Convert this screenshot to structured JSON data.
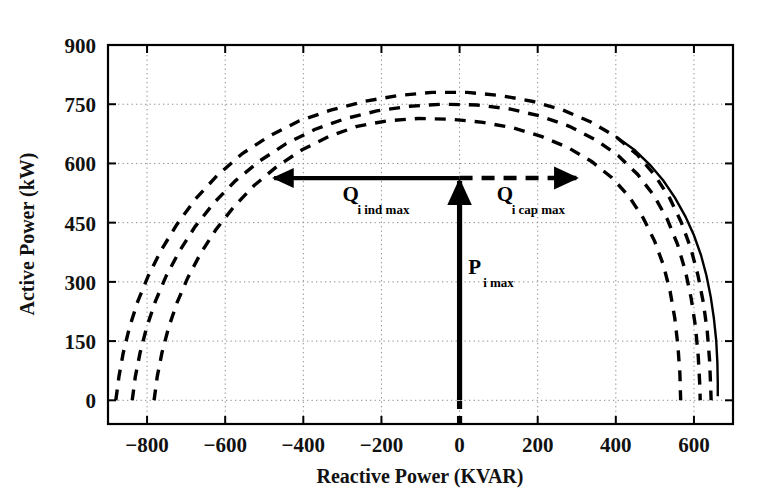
{
  "chart_data": {
    "type": "line",
    "title": "",
    "xlabel": "Reactive Power (KVAR)",
    "ylabel": "Active Power (kW)",
    "xlim": [
      -900,
      700
    ],
    "ylim": [
      -60,
      900
    ],
    "xticks": [
      -800,
      -600,
      -400,
      -200,
      0,
      200,
      400,
      600
    ],
    "yticks": [
      0,
      150,
      300,
      450,
      600,
      750,
      900
    ],
    "xtick_labels": [
      "−800",
      "−600",
      "−400",
      "−200",
      "0",
      "200",
      "400",
      "600"
    ],
    "ytick_labels": [
      "0",
      "150",
      "300",
      "450",
      "600",
      "750",
      "900"
    ],
    "grid": true,
    "legend": "none",
    "series": [
      {
        "name": "capability-curve-outer",
        "style": "dashed",
        "color": "#000000",
        "points": [
          [
            -880,
            0
          ],
          [
            -872,
            60
          ],
          [
            -861,
            120
          ],
          [
            -845,
            185
          ],
          [
            -824,
            250
          ],
          [
            -797,
            315
          ],
          [
            -764,
            380
          ],
          [
            -724,
            445
          ],
          [
            -676,
            510
          ],
          [
            -620,
            570
          ],
          [
            -556,
            625
          ],
          [
            -486,
            670
          ],
          [
            -410,
            708
          ],
          [
            -330,
            735
          ],
          [
            -245,
            757
          ],
          [
            -158,
            772
          ],
          [
            -70,
            780
          ],
          [
            20,
            780
          ],
          [
            105,
            772
          ],
          [
            188,
            757
          ],
          [
            265,
            735
          ],
          [
            336,
            705
          ],
          [
            400,
            668
          ],
          [
            455,
            622
          ],
          [
            500,
            570
          ],
          [
            538,
            512
          ],
          [
            568,
            450
          ],
          [
            592,
            385
          ],
          [
            610,
            318
          ],
          [
            624,
            248
          ],
          [
            634,
            176
          ],
          [
            640,
            102
          ],
          [
            643,
            30
          ],
          [
            644,
            0
          ]
        ]
      },
      {
        "name": "capability-curve-middle",
        "style": "dashed",
        "color": "#000000",
        "points": [
          [
            -838,
            0
          ],
          [
            -830,
            60
          ],
          [
            -818,
            120
          ],
          [
            -801,
            185
          ],
          [
            -779,
            250
          ],
          [
            -751,
            315
          ],
          [
            -717,
            378
          ],
          [
            -677,
            440
          ],
          [
            -629,
            500
          ],
          [
            -574,
            556
          ],
          [
            -512,
            606
          ],
          [
            -444,
            650
          ],
          [
            -371,
            686
          ],
          [
            -294,
            713
          ],
          [
            -212,
            733
          ],
          [
            -128,
            745
          ],
          [
            -42,
            750
          ],
          [
            45,
            748
          ],
          [
            128,
            738
          ],
          [
            207,
            720
          ],
          [
            281,
            694
          ],
          [
            348,
            660
          ],
          [
            406,
            620
          ],
          [
            456,
            572
          ],
          [
            498,
            518
          ],
          [
            532,
            458
          ],
          [
            558,
            395
          ],
          [
            578,
            328
          ],
          [
            593,
            258
          ],
          [
            604,
            186
          ],
          [
            611,
            112
          ],
          [
            615,
            38
          ],
          [
            616,
            0
          ]
        ]
      },
      {
        "name": "capability-curve-inner",
        "style": "dashed",
        "color": "#000000",
        "points": [
          [
            -782,
            0
          ],
          [
            -774,
            60
          ],
          [
            -762,
            120
          ],
          [
            -745,
            184
          ],
          [
            -723,
            248
          ],
          [
            -696,
            310
          ],
          [
            -663,
            372
          ],
          [
            -624,
            432
          ],
          [
            -578,
            490
          ],
          [
            -526,
            544
          ],
          [
            -468,
            592
          ],
          [
            -404,
            634
          ],
          [
            -335,
            668
          ],
          [
            -262,
            694
          ],
          [
            -185,
            708
          ],
          [
            -105,
            714
          ],
          [
            -22,
            712
          ],
          [
            60,
            704
          ],
          [
            138,
            690
          ],
          [
            211,
            668
          ],
          [
            278,
            640
          ],
          [
            338,
            605
          ],
          [
            390,
            564
          ],
          [
            434,
            516
          ],
          [
            470,
            462
          ],
          [
            499,
            404
          ],
          [
            522,
            342
          ],
          [
            539,
            276
          ],
          [
            551,
            208
          ],
          [
            559,
            138
          ],
          [
            564,
            68
          ],
          [
            566,
            0
          ]
        ]
      },
      {
        "name": "armature-limit-solid",
        "style": "solid",
        "color": "#000000",
        "points": [
          [
            400,
            668
          ],
          [
            448,
            634
          ],
          [
            488,
            596
          ],
          [
            522,
            556
          ],
          [
            552,
            512
          ],
          [
            578,
            466
          ],
          [
            600,
            418
          ],
          [
            618,
            368
          ],
          [
            632,
            316
          ],
          [
            643,
            262
          ],
          [
            651,
            208
          ],
          [
            657,
            152
          ],
          [
            660,
            96
          ],
          [
            661,
            44
          ],
          [
            661,
            10
          ]
        ]
      }
    ],
    "annotations": [
      {
        "name": "q-inductive-max-arrow",
        "kind": "arrow",
        "style": "solid",
        "from": [
          0,
          563
        ],
        "to": [
          -485,
          563
        ],
        "head": "end",
        "label_main": "Q",
        "label_sub": "i ind max",
        "label_x": -300,
        "label_y": 505
      },
      {
        "name": "q-capacitive-max-arrow",
        "kind": "arrow",
        "style": "dashed",
        "from": [
          0,
          563
        ],
        "to": [
          335,
          563
        ],
        "head": "end",
        "label_main": "Q",
        "label_sub": "i cap max",
        "label_x": 95,
        "label_y": 505
      },
      {
        "name": "p-max-arrow",
        "kind": "arrow",
        "style": "solid-with-dashed-tail",
        "from": [
          0,
          -60
        ],
        "to": [
          0,
          563
        ],
        "head": "end",
        "label_main": "P",
        "label_sub": "i max",
        "label_x": 22,
        "label_y": 320
      }
    ]
  },
  "axis": {
    "y_title": "Active Power (kW)",
    "x_title": "Reactive Power (KVAR)"
  },
  "annotations": {
    "q_ind": {
      "main": "Q",
      "sub": "i ind max"
    },
    "q_cap": {
      "main": "Q",
      "sub": "i cap max"
    },
    "p_max": {
      "main": "P",
      "sub": "i max"
    }
  },
  "colors": {
    "ink": "#000000",
    "grid": "#8a8a8a",
    "background": "#ffffff"
  }
}
